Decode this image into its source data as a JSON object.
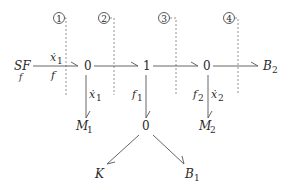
{
  "diagram": {
    "type": "bond-graph",
    "sections": [
      {
        "id": "section-1",
        "label": "1"
      },
      {
        "id": "section-2",
        "label": "2"
      },
      {
        "id": "section-3",
        "label": "3"
      },
      {
        "id": "section-4",
        "label": "4"
      }
    ],
    "nodes": {
      "source": {
        "label": "SF",
        "sub": "f"
      },
      "junction_a": {
        "label": "0"
      },
      "junction_b": {
        "label": "1"
      },
      "junction_c": {
        "label": "0"
      },
      "junction_d": {
        "label": "0"
      },
      "m1": {
        "label": "M",
        "sub": "1"
      },
      "m2": {
        "label": "M",
        "sub": "2"
      },
      "b2": {
        "label": "B",
        "sub": "2"
      },
      "k": {
        "label": "K"
      },
      "b1": {
        "label": "B",
        "sub": "1"
      }
    },
    "bond_labels": {
      "source_flow_top": {
        "label": "ẋ",
        "sub": "1"
      },
      "source_effort_bottom": {
        "label": "f"
      },
      "m1_flow": {
        "label": "ẋ",
        "sub": "1"
      },
      "b_effort": {
        "label": "f",
        "sub": "1"
      },
      "m2_effort": {
        "label": "f",
        "sub": "2"
      },
      "m2_flow": {
        "label": "ẋ",
        "sub": "2"
      }
    }
  }
}
